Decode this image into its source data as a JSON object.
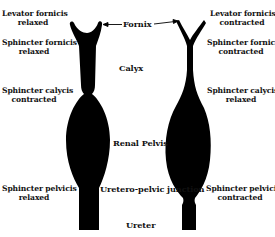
{
  "diagram": {
    "title_labels": {
      "fornix": "Fornix",
      "calyx": "Calyx",
      "renal_pelvis": "Renal Pelvis",
      "uretero_pelvic_junction": "Uretero-pelvic junction",
      "ureter": "Ureter"
    },
    "left": {
      "levator": [
        "Levator fornicis",
        "relaxed"
      ],
      "sphincter_fornicis": [
        "Sphincter fornicis",
        "relaxed"
      ],
      "sphincter_calycis": [
        "Sphincter calycis",
        "contracted"
      ],
      "sphincter_pelvicis": [
        "Sphincter pelvicis",
        "relaxed"
      ]
    },
    "right": {
      "levator": [
        "Levator fornicis",
        "contracted"
      ],
      "sphincter_fornicis": [
        "Sphincter fornicis",
        "contracted"
      ],
      "sphincter_calycis": [
        "Sphincter calycis",
        "relaxed"
      ],
      "sphincter_pelvicis": [
        "Sphincter pelvicis",
        "contracted"
      ]
    },
    "colors": {
      "shape": "#000000",
      "background": "#ffffff"
    }
  }
}
